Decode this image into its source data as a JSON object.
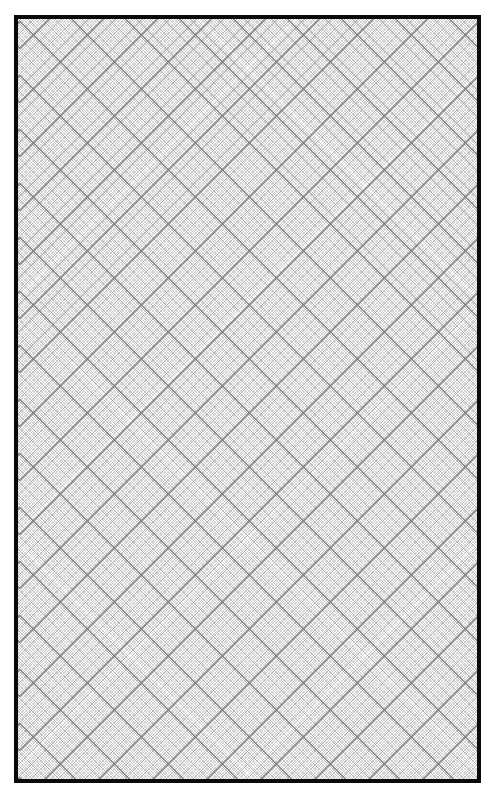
{
  "page": {
    "type": "diagonal graph paper",
    "background_color": "#ffffff",
    "border_color": "#0a0a0a",
    "grid_line_color": "#8a8a8a",
    "major_line_color": "#5f5f5f"
  },
  "frame": {
    "x": 14,
    "y": 15,
    "width": 467,
    "height": 768,
    "border_width": 4
  },
  "grid": {
    "orientation_degrees": [
      45,
      -45
    ],
    "major_period_px": 54,
    "fine_lines_per_major": 20
  }
}
